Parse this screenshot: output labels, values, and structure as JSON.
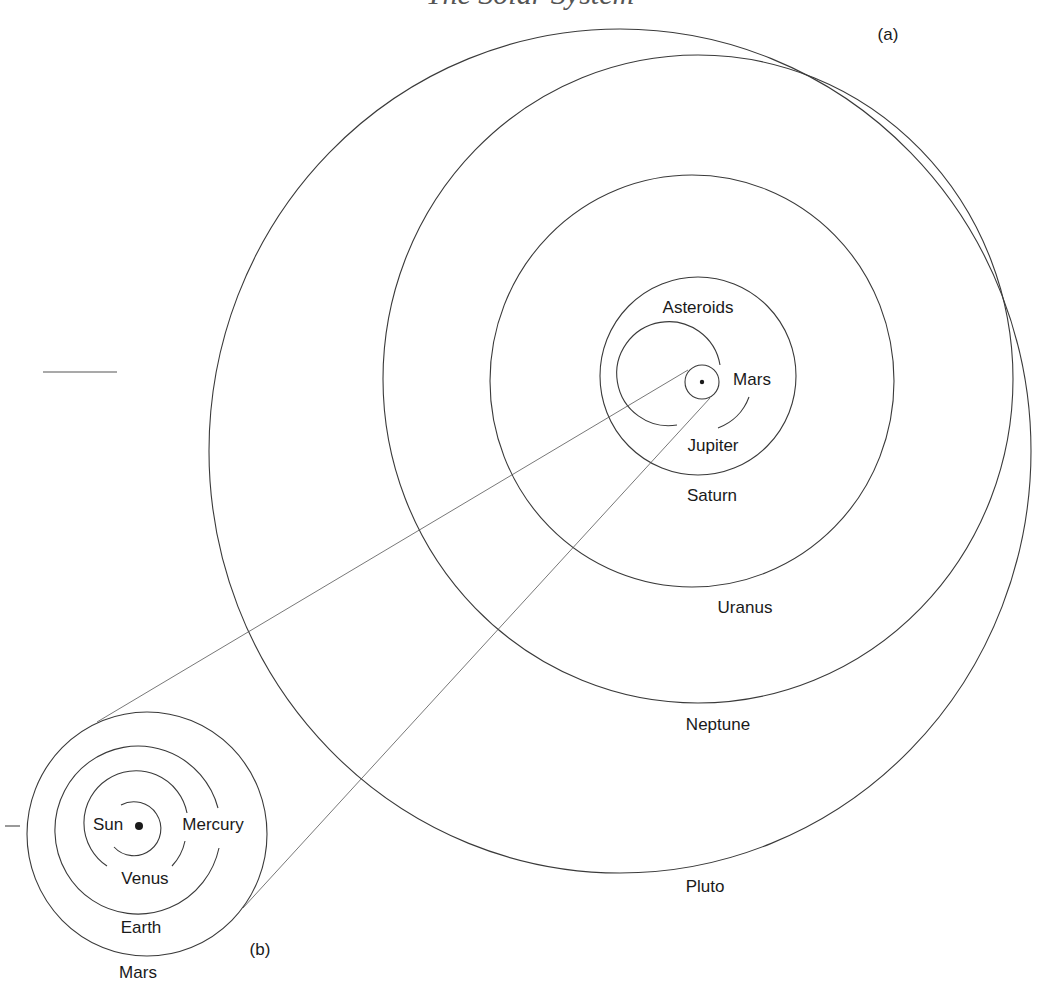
{
  "diagram": {
    "title_partial": "The Solar System",
    "panel_a": {
      "label": "(a)",
      "center_body": "Sun",
      "orbits": [
        {
          "name": "Mars",
          "label": "Mars"
        },
        {
          "name": "Jupiter",
          "label": "Jupiter"
        },
        {
          "name": "Asteroids",
          "label": "Asteroids"
        },
        {
          "name": "Saturn",
          "label": "Saturn"
        },
        {
          "name": "Uranus",
          "label": "Uranus"
        },
        {
          "name": "Neptune",
          "label": "Neptune"
        },
        {
          "name": "Pluto",
          "label": "Pluto"
        }
      ]
    },
    "panel_b": {
      "label": "(b)",
      "center_body": "Sun",
      "orbits": [
        {
          "name": "Mercury",
          "label": "Mercury"
        },
        {
          "name": "Venus",
          "label": "Venus"
        },
        {
          "name": "Earth",
          "label": "Earth"
        },
        {
          "name": "Mars",
          "label": "Mars"
        }
      ]
    },
    "colors": {
      "line": "#3a3a3a",
      "text": "#1a1a1a",
      "background": "#ffffff"
    }
  }
}
